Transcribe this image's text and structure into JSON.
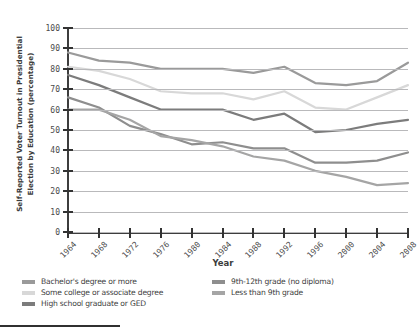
{
  "top_strip_text": "",
  "axis": {
    "ylabel": "Self-Reported Voter Turnout in Presidential Election by Education (percentage)",
    "xlabel": "Year"
  },
  "legend": {
    "items": [
      {
        "label": "Bachelor's degree or more",
        "color": "#9a9a9a",
        "col": "a",
        "row": 0
      },
      {
        "label": "Some college or associate degree",
        "color": "#d8d8d8",
        "col": "a",
        "row": 1
      },
      {
        "label": "High school graduate or GED",
        "color": "#7c7c7c",
        "col": "a",
        "row": 2
      },
      {
        "label": "9th-12th grade (no diploma)",
        "color": "#8e8e8e",
        "col": "b",
        "row": 0
      },
      {
        "label": "Less than 9th grade",
        "color": "#a5a5a5",
        "col": "b",
        "row": 1
      }
    ]
  },
  "chart_data": {
    "type": "line",
    "title": "",
    "xlabel": "Year",
    "ylabel": "Self-Reported Voter Turnout in Presidential Election by Education (percentage)",
    "x": [
      1964,
      1968,
      1972,
      1976,
      1980,
      1984,
      1988,
      1992,
      1996,
      2000,
      2004,
      2008
    ],
    "xlim": [
      1964,
      2008
    ],
    "ylim": [
      0,
      100
    ],
    "yticks": [
      0,
      10,
      20,
      30,
      40,
      50,
      60,
      70,
      80,
      90,
      100
    ],
    "xticks": [
      "1964",
      "1968",
      "1972",
      "1976",
      "1980",
      "1984",
      "1988",
      "1992",
      "1996",
      "2000",
      "2004",
      "2008"
    ],
    "grid": true,
    "legend_position": "below",
    "series": [
      {
        "name": "Bachelor's degree or more",
        "color": "#9a9a9a",
        "values": [
          88,
          84,
          83,
          80,
          80,
          80,
          78,
          81,
          73,
          72,
          74,
          83
        ]
      },
      {
        "name": "Some college or associate degree",
        "color": "#d8d8d8",
        "values": [
          81,
          79,
          75,
          69,
          68,
          68,
          65,
          69,
          61,
          60,
          66,
          72
        ]
      },
      {
        "name": "High school graduate or GED",
        "color": "#7c7c7c",
        "values": [
          77,
          72,
          66,
          60,
          60,
          60,
          55,
          58,
          49,
          50,
          53,
          55
        ]
      },
      {
        "name": "9th-12th grade (no diploma)",
        "color": "#8e8e8e",
        "values": [
          66,
          61,
          52,
          48,
          43,
          44,
          41,
          41,
          34,
          34,
          35,
          39
        ]
      },
      {
        "name": "Less than 9th grade",
        "color": "#a5a5a5",
        "values": [
          60,
          60,
          55,
          47,
          45,
          42,
          37,
          35,
          30,
          27,
          23,
          24
        ]
      }
    ]
  }
}
